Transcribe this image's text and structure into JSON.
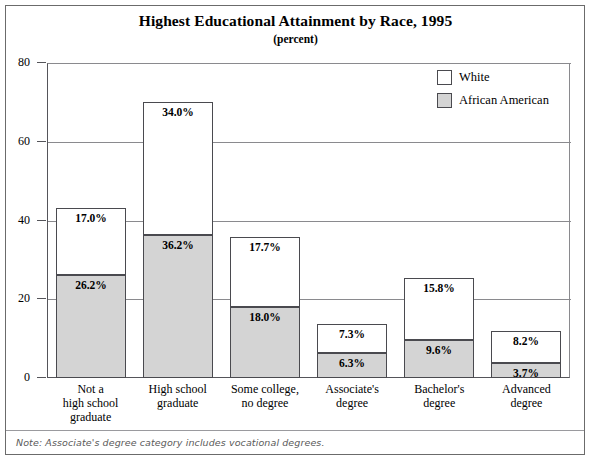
{
  "chart_data": {
    "type": "bar",
    "subtype": "stacked-column",
    "title": "Highest Educational Attainment by Race, 1995",
    "subtitle": "(percent)",
    "xlabel": "",
    "ylabel": "",
    "ylim": [
      0,
      80
    ],
    "yticks": [
      "0",
      "20",
      "40",
      "60",
      "80"
    ],
    "grid": true,
    "legend_position": "top-right",
    "categories": [
      "Not a\nhigh school\ngraduate",
      "High school\ngraduate",
      "Some college,\nno degree",
      "Associate's\ndegree",
      "Bachelor's\ndegree",
      "Advanced\ndegree"
    ],
    "category_lines": [
      [
        "Not a",
        "high school",
        "graduate"
      ],
      [
        "High school",
        "graduate"
      ],
      [
        "Some college,",
        "no degree"
      ],
      [
        "Associate's",
        "degree"
      ],
      [
        "Bachelor's",
        "degree"
      ],
      [
        "Advanced",
        "degree"
      ]
    ],
    "series": [
      {
        "name": "White",
        "color": "#ffffff",
        "values": [
          17.0,
          34.0,
          17.7,
          7.3,
          15.8,
          8.2
        ],
        "labels": [
          "17.0%",
          "34.0%",
          "17.7%",
          "7.3%",
          "15.8%",
          "8.2%"
        ]
      },
      {
        "name": "African American",
        "color": "#d4d4d4",
        "values": [
          26.2,
          36.2,
          18.0,
          6.3,
          9.6,
          3.7
        ],
        "labels": [
          "26.2%",
          "36.2%",
          "18.0%",
          "6.3%",
          "9.6%",
          "3.7%"
        ]
      }
    ],
    "stacked_totals": [
      43.2,
      70.2,
      35.7,
      13.6,
      25.4,
      11.9
    ],
    "note": "Note: Associate's degree category includes vocational degrees.",
    "note_prefix": "Note:",
    "note_body": " Associate's degree category includes vocational degrees."
  },
  "legend": {
    "items": [
      {
        "label": "White",
        "swatch": "white-swatch"
      },
      {
        "label": "African American",
        "swatch": "gray-swatch"
      }
    ]
  },
  "colors": {
    "bar_white": "#ffffff",
    "bar_gray": "#d4d4d4",
    "bar_outline": "#4a4a4f",
    "frame": "#6b6b6b",
    "gridline": "#8a8a8e",
    "text": "#000000",
    "note_text": "#5a5a5a"
  }
}
